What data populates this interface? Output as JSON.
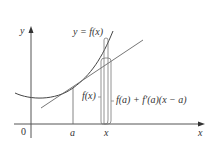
{
  "diagram": {
    "colors": {
      "curve": "#444444",
      "tangent": "#666666",
      "axes": "#555555",
      "text": "#333333"
    },
    "labels": {
      "y_axis": "y",
      "x_axis": "x",
      "origin": "0",
      "a_tick": "a",
      "x_tick": "x",
      "curve": "y = f(x)",
      "fx": "f(x)",
      "tangent_value": "f(a) + f′(a)(x − a)"
    }
  }
}
